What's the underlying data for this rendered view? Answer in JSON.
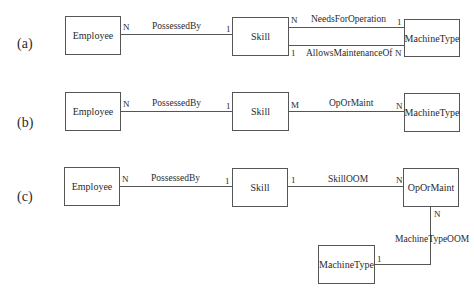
{
  "panels": {
    "a": {
      "label": "(a)",
      "entities": {
        "employee": "Employee",
        "skill": "Skill",
        "machine_type": "MachineType"
      },
      "relationships": {
        "possessed_by": {
          "name": "PossessedBy",
          "card_left": "N",
          "card_right": "1"
        },
        "needs_for_operation": {
          "name": "NeedsForOperation",
          "card_left": "N",
          "card_right": "1"
        },
        "allows_maintenance_of": {
          "name": "AllowsMaintenanceOf",
          "card_left": "1",
          "card_right": "N"
        }
      }
    },
    "b": {
      "label": "(b)",
      "entities": {
        "employee": "Employee",
        "skill": "Skill",
        "machine_type": "MachineType"
      },
      "relationships": {
        "possessed_by": {
          "name": "PossessedBy",
          "card_left": "N",
          "card_right": "1"
        },
        "op_or_maint": {
          "name": "OpOrMaint",
          "card_left": "M",
          "card_right": "N"
        }
      }
    },
    "c": {
      "label": "(c)",
      "entities": {
        "employee": "Employee",
        "skill": "Skill",
        "op_or_maint": "OpOrMaint",
        "machine_type": "MachineType"
      },
      "relationships": {
        "possessed_by": {
          "name": "PossessedBy",
          "card_left": "N",
          "card_right": "1"
        },
        "skill_oom": {
          "name": "SkillOOM",
          "card_left": "1",
          "card_right": "N"
        },
        "machine_type_oom": {
          "name": "MachineTypeOOM",
          "card_top": "N",
          "card_bottom": "1"
        }
      }
    }
  }
}
